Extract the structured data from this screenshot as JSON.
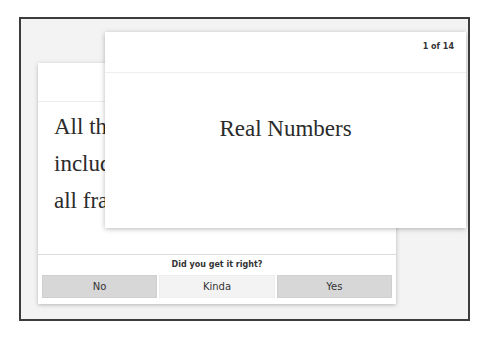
{
  "colors": {
    "frame_border": "#3c3c3c",
    "frame_background": "#f3f3f3",
    "card_background": "#ffffff",
    "button_shaded": "#d7d7d7",
    "button_light": "#f3f3f3",
    "text": "#2b2b2b"
  },
  "front_card": {
    "counter": "1 of 14",
    "term": "Real Numbers"
  },
  "back_card": {
    "definition_lines": [
      "All the",
      "includ",
      "all fra"
    ],
    "footer": {
      "question": "Did you get it right?",
      "buttons": [
        {
          "label": "No"
        },
        {
          "label": "Kinda"
        },
        {
          "label": "Yes"
        }
      ]
    }
  }
}
